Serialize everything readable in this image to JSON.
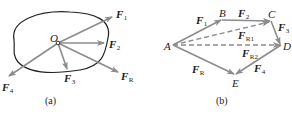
{
  "figure": {
    "panel_a": {
      "caption": "(a)",
      "origin_label": "O",
      "forces": [
        {
          "symbol": "F",
          "sub": "1"
        },
        {
          "symbol": "F",
          "sub": "2"
        },
        {
          "symbol": "F",
          "sub": "3"
        },
        {
          "symbol": "F",
          "sub": "4"
        },
        {
          "symbol": "F",
          "sub": "R"
        }
      ]
    },
    "panel_b": {
      "caption": "(b)",
      "points": {
        "A": "A",
        "B": "B",
        "C": "C",
        "D": "D",
        "E": "E"
      },
      "vectors": [
        {
          "symbol": "F",
          "sub": "1"
        },
        {
          "symbol": "F",
          "sub": "2"
        },
        {
          "symbol": "F",
          "sub": "3"
        },
        {
          "symbol": "F",
          "sub": "4"
        },
        {
          "symbol": "F",
          "sub": "R"
        },
        {
          "symbol": "F",
          "sub": "R1"
        },
        {
          "symbol": "F",
          "sub": "R2"
        }
      ]
    },
    "colors": {
      "arrow": "#8c8c8c",
      "outline": "#222222",
      "text": "#222222"
    }
  }
}
